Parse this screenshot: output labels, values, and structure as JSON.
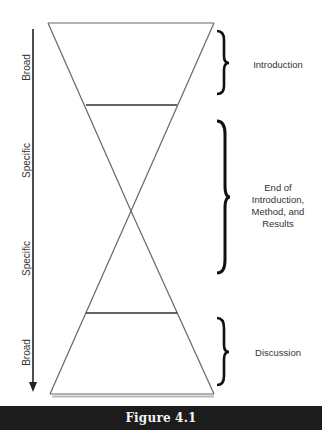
{
  "axis": {
    "direction": "top-to-bottom",
    "labels": [
      "Broad",
      "Specific",
      "Specific",
      "Broad"
    ]
  },
  "sections": [
    {
      "label": "Introduction"
    },
    {
      "label": "End of\nIntroduction,\nMethod, and\nResults",
      "lines": [
        "End of",
        "Introduction,",
        "Method, and",
        "Results"
      ]
    },
    {
      "label": "Discussion"
    }
  ],
  "caption": "Figure 4.1",
  "colors": {
    "line": "#555555",
    "divider": "#333333",
    "brace": "#111111",
    "caption_bg": "#1c1c1c",
    "caption_text": "#f2f2f2"
  }
}
